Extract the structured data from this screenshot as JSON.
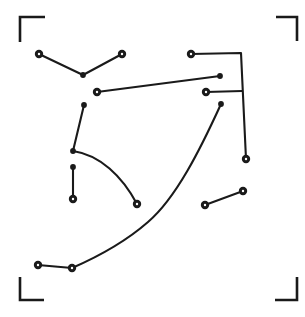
{
  "canvas": {
    "width": 305,
    "height": 317,
    "background": "#ffffff",
    "stroke_color": "#1a1a1a",
    "node_fill": "#1a1a1a",
    "node_center": "#ffffff",
    "stroke_width": 2.1,
    "node_radius": 4.2,
    "node_inner_radius": 1.2,
    "title": "Crop marks with node-link sketch"
  },
  "crop_marks": {
    "arm_length": 24,
    "stroke_width": 2.6,
    "corners": [
      {
        "name": "top-left",
        "path": "M 20 42 L 20 17 L 45 17"
      },
      {
        "name": "top-right",
        "path": "M 276 17 L 297 17 L 297 41"
      },
      {
        "name": "bottom-left",
        "path": "M 20 277 L 20 300 L 44 300"
      },
      {
        "name": "bottom-right",
        "path": "M 275 300 L 297 300 L 297 277"
      }
    ]
  },
  "paths": [
    {
      "name": "vee-polyline-top-left",
      "kind": "polyline",
      "d": "M 39 54 L 83 75 L 122 54"
    },
    {
      "name": "long-diagonal-mid",
      "kind": "line",
      "d": "M 97 92 L 220 76"
    },
    {
      "name": "top-right-bracket-polyline",
      "kind": "polyline",
      "d": "M 191 54 L 241 53 L 246 159"
    },
    {
      "name": "right-stub-to-vertical",
      "kind": "line",
      "d": "M 206 92 L 242 91"
    },
    {
      "name": "left-elbow-with-curve",
      "kind": "curve",
      "d": "M 84 105 L 73 151 C 100 155 122 176 137 204"
    },
    {
      "name": "short-vertical-left",
      "kind": "line",
      "d": "M 73 167 L 73 199"
    },
    {
      "name": "long-sweeping-curve",
      "kind": "curve",
      "d": "M 221 104 C 200 150 176 198 148 222 C 124 243 95 258 72 268 L 38 265"
    },
    {
      "name": "short-diagonal-lower-right",
      "kind": "line",
      "d": "M 205 205 L 243 191"
    }
  ],
  "nodes": [
    {
      "name": "node-upper-left",
      "cx": 39,
      "cy": 54,
      "style": "ring"
    },
    {
      "name": "node-vee-vertex",
      "cx": 83,
      "cy": 75,
      "style": "dot"
    },
    {
      "name": "node-upper-right-of-vee",
      "cx": 122,
      "cy": 54,
      "style": "ring"
    },
    {
      "name": "node-line-left",
      "cx": 97,
      "cy": 92,
      "style": "ring"
    },
    {
      "name": "node-line-right",
      "cx": 220,
      "cy": 76,
      "style": "dot"
    },
    {
      "name": "node-bracket-start",
      "cx": 191,
      "cy": 54,
      "style": "ring"
    },
    {
      "name": "node-bracket-end",
      "cx": 246,
      "cy": 159,
      "style": "ring"
    },
    {
      "name": "node-stub-left",
      "cx": 206,
      "cy": 92,
      "style": "ring"
    },
    {
      "name": "node-elbow-top",
      "cx": 84,
      "cy": 105,
      "style": "dot"
    },
    {
      "name": "node-elbow-vertex",
      "cx": 73,
      "cy": 151,
      "style": "dot"
    },
    {
      "name": "node-curve-end-left",
      "cx": 137,
      "cy": 204,
      "style": "ring"
    },
    {
      "name": "node-short-vert-top",
      "cx": 73,
      "cy": 167,
      "style": "dot"
    },
    {
      "name": "node-short-vert-bottom",
      "cx": 73,
      "cy": 199,
      "style": "ring"
    },
    {
      "name": "node-sweep-top",
      "cx": 221,
      "cy": 104,
      "style": "dot"
    },
    {
      "name": "node-sweep-mid",
      "cx": 72,
      "cy": 268,
      "style": "ring"
    },
    {
      "name": "node-sweep-end",
      "cx": 38,
      "cy": 265,
      "style": "ring"
    },
    {
      "name": "node-diag-lower-left",
      "cx": 205,
      "cy": 205,
      "style": "ring"
    },
    {
      "name": "node-diag-upper-right",
      "cx": 243,
      "cy": 191,
      "style": "ring"
    }
  ]
}
